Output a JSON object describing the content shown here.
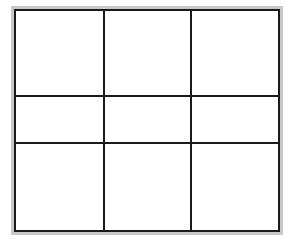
{
  "diagram": {
    "type": "grid",
    "rows": 3,
    "columns": 3,
    "frame_color": "#c8c8c8",
    "line_color": "#1a1a1a",
    "background": "#ffffff",
    "cells": [
      {
        "row": 1,
        "col": 1
      },
      {
        "row": 1,
        "col": 2
      },
      {
        "row": 1,
        "col": 3
      },
      {
        "row": 2,
        "col": 1
      },
      {
        "row": 2,
        "col": 2
      },
      {
        "row": 2,
        "col": 3
      },
      {
        "row": 3,
        "col": 1
      },
      {
        "row": 3,
        "col": 2
      },
      {
        "row": 3,
        "col": 3
      }
    ]
  }
}
